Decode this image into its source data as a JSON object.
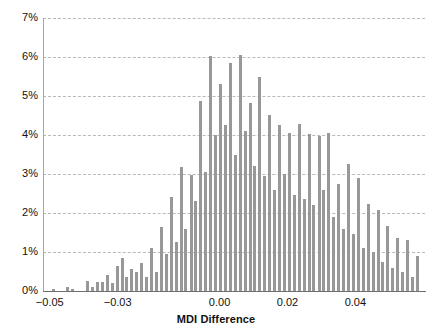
{
  "chart_data": {
    "type": "bar",
    "title": "",
    "xlabel": "MDI Difference",
    "ylabel": "",
    "xlim": [
      -0.052,
      0.0605
    ],
    "ylim": [
      0,
      7
    ],
    "y_tick_labels": [
      "0%",
      "1%",
      "2%",
      "3%",
      "4%",
      "5%",
      "6%",
      "7%"
    ],
    "y_tick_values": [
      0,
      1,
      2,
      3,
      4,
      5,
      6,
      7
    ],
    "x_tick_labels": [
      "-0.05",
      "-0.03",
      "0.00",
      "0.02",
      "0.04"
    ],
    "x_tick_values": [
      -0.05,
      -0.03,
      0.0,
      0.02,
      0.04
    ],
    "grid": "horizontal-dashed",
    "legend": "none",
    "bar_color": "#989898",
    "bin_width": 0.00145,
    "x": [
      -0.049,
      -0.0476,
      -0.0461,
      -0.0447,
      -0.0432,
      -0.0418,
      -0.0403,
      -0.0389,
      -0.0374,
      -0.036,
      -0.0345,
      -0.0331,
      -0.0316,
      -0.0302,
      -0.0287,
      -0.0273,
      -0.0258,
      -0.0244,
      -0.0229,
      -0.0215,
      -0.02,
      -0.0186,
      -0.0171,
      -0.0157,
      -0.0142,
      -0.0128,
      -0.0113,
      -0.0099,
      -0.0084,
      -0.007,
      -0.0055,
      -0.0041,
      -0.0026,
      -0.0012,
      0.0003,
      0.0017,
      0.0032,
      0.0046,
      0.0061,
      0.0075,
      0.009,
      0.0104,
      0.0119,
      0.0133,
      0.0148,
      0.0162,
      0.0177,
      0.0191,
      0.0206,
      0.022,
      0.0235,
      0.0249,
      0.0264,
      0.0278,
      0.0293,
      0.0307,
      0.0322,
      0.0336,
      0.0351,
      0.0365,
      0.038,
      0.0394,
      0.0409,
      0.0423,
      0.0438,
      0.0452,
      0.0467,
      0.0481,
      0.0496,
      0.051,
      0.0525,
      0.0539,
      0.0554,
      0.0568,
      0.0583
    ],
    "values": [
      0.05,
      0.0,
      0.0,
      0.1,
      0.05,
      0.0,
      0.0,
      0.25,
      0.1,
      0.22,
      0.22,
      0.4,
      0.2,
      0.65,
      0.85,
      0.35,
      0.57,
      0.5,
      0.73,
      0.35,
      1.1,
      0.5,
      1.63,
      0.95,
      2.4,
      1.25,
      3.18,
      1.6,
      2.98,
      2.3,
      4.88,
      3.05,
      6.03,
      4.0,
      5.3,
      4.25,
      5.85,
      3.5,
      6.05,
      4.1,
      4.82,
      3.2,
      5.48,
      2.95,
      4.52,
      2.6,
      4.25,
      3.0,
      4.05,
      2.45,
      4.28,
      2.35,
      4.03,
      2.2,
      3.98,
      2.6,
      4.05,
      1.9,
      2.75,
      1.6,
      3.25,
      1.45,
      2.9,
      1.1,
      2.23,
      1.0,
      2.08,
      0.75,
      1.67,
      0.6,
      1.37,
      0.5,
      1.3,
      0.35,
      0.9
    ],
    "series_name": "MDI Difference distribution",
    "bar_count": 75,
    "peak_value": 6.05,
    "peak_x": 0.0061
  },
  "axes": {
    "x_title": "MDI Difference",
    "y_ticks": [
      "0%",
      "1%",
      "2%",
      "3%",
      "4%",
      "5%",
      "6%",
      "7%"
    ],
    "x_ticks": [
      "-0.05",
      "-0.03",
      "0.00",
      "0.02",
      "0.04"
    ]
  },
  "colors": {
    "bar": "#989898",
    "grid": "#b9b9b9",
    "axis": "#6e6e6e",
    "text": "#111111",
    "background": "#ffffff"
  }
}
